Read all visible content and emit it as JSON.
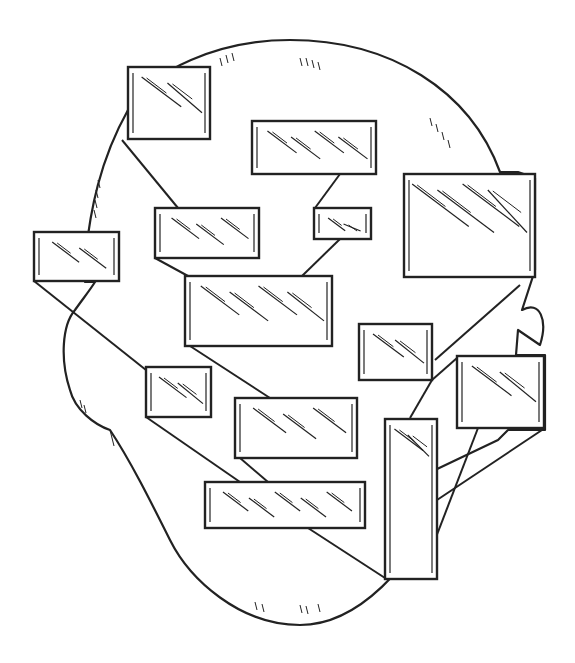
{
  "illustration": {
    "subject": "head silhouette composed of glass panes connected by lines",
    "stroke_color": "#222222",
    "background": "#ffffff",
    "head_outline": "M 128 110 C 150 70 220 40 290 40 C 390 40 470 90 500 172 L 518 172 L 535 178 L 535 270 L 522 310 C 540 300 548 320 540 345 L 518 330 L 516 355 L 545 355 L 545 430 L 508 430 L 498 440 L 435 470 L 430 515 C 415 560 360 625 300 625 C 240 625 190 580 170 540 C 150 500 130 460 110 430 C 95 425 75 410 70 390 C 60 360 62 325 75 310 C 82 300 90 290 95 282 L 85 282 L 85 260 C 90 210 100 160 128 110 Z",
    "panes": [
      {
        "name": "pane-top-left",
        "x": 128,
        "y": 67,
        "w": 82,
        "h": 72
      },
      {
        "name": "pane-top-center",
        "x": 252,
        "y": 121,
        "w": 124,
        "h": 53
      },
      {
        "name": "pane-right-large",
        "x": 404,
        "y": 174,
        "w": 131,
        "h": 103
      },
      {
        "name": "pane-mid-left",
        "x": 155,
        "y": 208,
        "w": 104,
        "h": 50
      },
      {
        "name": "pane-mid-small",
        "x": 314,
        "y": 208,
        "w": 57,
        "h": 31
      },
      {
        "name": "pane-far-left",
        "x": 34,
        "y": 232,
        "w": 85,
        "h": 49
      },
      {
        "name": "pane-center-large",
        "x": 185,
        "y": 276,
        "w": 147,
        "h": 70
      },
      {
        "name": "pane-right-mid",
        "x": 359,
        "y": 324,
        "w": 73,
        "h": 56
      },
      {
        "name": "pane-far-right",
        "x": 457,
        "y": 356,
        "w": 87,
        "h": 72
      },
      {
        "name": "pane-left-small",
        "x": 146,
        "y": 367,
        "w": 65,
        "h": 50
      },
      {
        "name": "pane-center-lower",
        "x": 235,
        "y": 398,
        "w": 122,
        "h": 60
      },
      {
        "name": "pane-vertical-tall",
        "x": 385,
        "y": 419,
        "w": 52,
        "h": 160
      },
      {
        "name": "pane-bottom-wide",
        "x": 205,
        "y": 482,
        "w": 160,
        "h": 46
      }
    ],
    "connectors": [
      [
        122,
        140,
        178,
        208
      ],
      [
        340,
        174,
        315,
        208
      ],
      [
        155,
        258,
        188,
        276
      ],
      [
        340,
        239,
        302,
        276
      ],
      [
        34,
        281,
        146,
        370
      ],
      [
        190,
        346,
        270,
        398
      ],
      [
        146,
        417,
        240,
        482
      ],
      [
        240,
        458,
        268,
        482
      ],
      [
        308,
        528,
        385,
        578
      ],
      [
        432,
        380,
        457,
        358
      ],
      [
        435,
        360,
        520,
        285
      ],
      [
        437,
        500,
        545,
        428
      ],
      [
        433,
        545,
        478,
        428
      ],
      [
        410,
        418,
        432,
        380
      ]
    ]
  }
}
